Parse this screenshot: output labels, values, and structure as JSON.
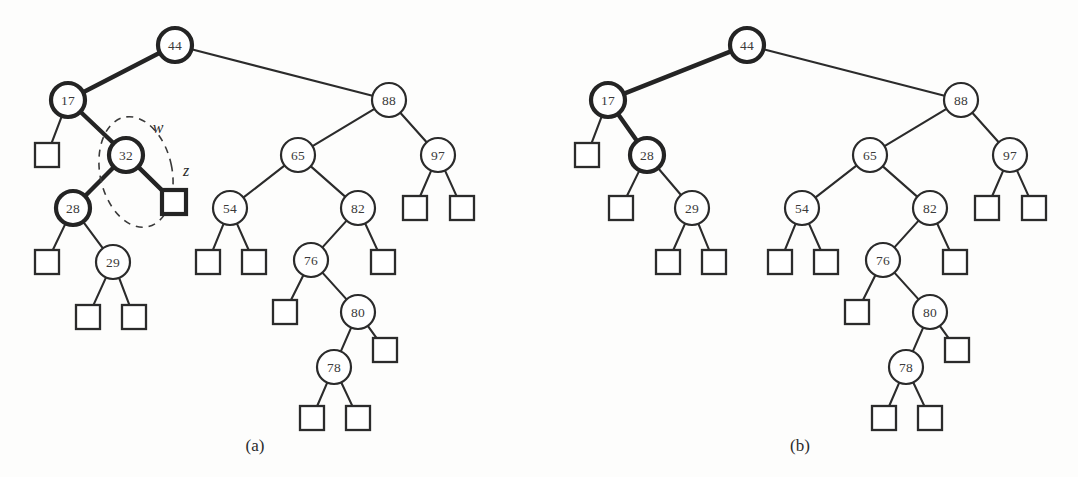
{
  "figure": {
    "background_color": "#fdfdfc",
    "ink_color": "#2b2b2b",
    "highlight_color": "#242424",
    "panels": [
      {
        "id": "a",
        "caption": "(a)",
        "caption_x": 255,
        "caption_y": 445
      },
      {
        "id": "b",
        "caption": "(b)",
        "caption_y": 445,
        "caption_x": 800
      }
    ],
    "annotations": [
      {
        "id": "w",
        "label": "w",
        "x": 158,
        "y": 127,
        "describes": "node-32"
      },
      {
        "id": "z",
        "label": "z",
        "x": 186,
        "y": 170,
        "describes": "leaf-right-of-32"
      }
    ],
    "highlight_ellipse": {
      "cx": 136,
      "cy": 172,
      "rx": 36,
      "ry": 56,
      "rotate": -12,
      "encircles": [
        "node-32",
        "leaf-right-of-32"
      ]
    }
  },
  "panel_a": {
    "caption": "(a)",
    "nodes": [
      {
        "id": "a44",
        "label": "44",
        "x": 175,
        "y": 45,
        "r": 17,
        "thick": true
      },
      {
        "id": "a17",
        "label": "17",
        "x": 68,
        "y": 100,
        "r": 17,
        "thick": true
      },
      {
        "id": "a88",
        "label": "88",
        "x": 389,
        "y": 100,
        "r": 17,
        "thick": false
      },
      {
        "id": "a32",
        "label": "32",
        "x": 126,
        "y": 155,
        "r": 17,
        "thick": true
      },
      {
        "id": "a65",
        "label": "65",
        "x": 298,
        "y": 155,
        "r": 17,
        "thick": false
      },
      {
        "id": "a97",
        "label": "97",
        "x": 438,
        "y": 155,
        "r": 17,
        "thick": false
      },
      {
        "id": "a28",
        "label": "28",
        "x": 73,
        "y": 208,
        "r": 17,
        "thick": true
      },
      {
        "id": "a54",
        "label": "54",
        "x": 230,
        "y": 208,
        "r": 17,
        "thick": false
      },
      {
        "id": "a82",
        "label": "82",
        "x": 358,
        "y": 208,
        "r": 17,
        "thick": false
      },
      {
        "id": "a29",
        "label": "29",
        "x": 113,
        "y": 262,
        "r": 17,
        "thick": false
      },
      {
        "id": "a76",
        "label": "76",
        "x": 311,
        "y": 260,
        "r": 17,
        "thick": false
      },
      {
        "id": "a80",
        "label": "80",
        "x": 358,
        "y": 312,
        "r": 17,
        "thick": false
      },
      {
        "id": "a78",
        "label": "78",
        "x": 334,
        "y": 367,
        "r": 17,
        "thick": false
      }
    ],
    "leaves": [
      {
        "id": "aL1",
        "x": 47,
        "y": 155,
        "s": 24,
        "thick": false
      },
      {
        "id": "aL2",
        "x": 174,
        "y": 202,
        "s": 24,
        "thick": true
      },
      {
        "id": "aL3",
        "x": 47,
        "y": 262,
        "s": 24,
        "thick": false
      },
      {
        "id": "aL4",
        "x": 88,
        "y": 317,
        "s": 24,
        "thick": false
      },
      {
        "id": "aL5",
        "x": 134,
        "y": 317,
        "s": 24,
        "thick": false
      },
      {
        "id": "aL6",
        "x": 208,
        "y": 262,
        "s": 24,
        "thick": false
      },
      {
        "id": "aL7",
        "x": 254,
        "y": 262,
        "s": 24,
        "thick": false
      },
      {
        "id": "aL8",
        "x": 285,
        "y": 312,
        "s": 24,
        "thick": false
      },
      {
        "id": "aL9",
        "x": 383,
        "y": 262,
        "s": 24,
        "thick": false
      },
      {
        "id": "aL10",
        "x": 385,
        "y": 350,
        "s": 24,
        "thick": false
      },
      {
        "id": "aL11",
        "x": 312,
        "y": 418,
        "s": 24,
        "thick": false
      },
      {
        "id": "aL12",
        "x": 358,
        "y": 418,
        "s": 24,
        "thick": false
      },
      {
        "id": "aL13",
        "x": 415,
        "y": 208,
        "s": 24,
        "thick": false
      },
      {
        "id": "aL14",
        "x": 462,
        "y": 208,
        "s": 24,
        "thick": false
      }
    ],
    "edges": [
      {
        "from": "a44",
        "to": "a17",
        "thick": true
      },
      {
        "from": "a44",
        "to": "a88",
        "thick": false
      },
      {
        "from": "a17",
        "to": "aL1",
        "thick": false
      },
      {
        "from": "a17",
        "to": "a32",
        "thick": true
      },
      {
        "from": "a32",
        "to": "a28",
        "thick": true
      },
      {
        "from": "a32",
        "to": "aL2",
        "thick": true
      },
      {
        "from": "a28",
        "to": "aL3",
        "thick": false
      },
      {
        "from": "a28",
        "to": "a29",
        "thick": false
      },
      {
        "from": "a29",
        "to": "aL4",
        "thick": false
      },
      {
        "from": "a29",
        "to": "aL5",
        "thick": false
      },
      {
        "from": "a88",
        "to": "a65",
        "thick": false
      },
      {
        "from": "a88",
        "to": "a97",
        "thick": false
      },
      {
        "from": "a97",
        "to": "aL13",
        "thick": false
      },
      {
        "from": "a97",
        "to": "aL14",
        "thick": false
      },
      {
        "from": "a65",
        "to": "a54",
        "thick": false
      },
      {
        "from": "a65",
        "to": "a82",
        "thick": false
      },
      {
        "from": "a54",
        "to": "aL6",
        "thick": false
      },
      {
        "from": "a54",
        "to": "aL7",
        "thick": false
      },
      {
        "from": "a82",
        "to": "a76",
        "thick": false
      },
      {
        "from": "a82",
        "to": "aL9",
        "thick": false
      },
      {
        "from": "a76",
        "to": "aL8",
        "thick": false
      },
      {
        "from": "a76",
        "to": "a80",
        "thick": false
      },
      {
        "from": "a80",
        "to": "a78",
        "thick": false
      },
      {
        "from": "a80",
        "to": "aL10",
        "thick": false
      },
      {
        "from": "a78",
        "to": "aL11",
        "thick": false
      },
      {
        "from": "a78",
        "to": "aL12",
        "thick": false
      }
    ]
  },
  "panel_b": {
    "caption": "(b)",
    "nodes": [
      {
        "id": "b44",
        "label": "44",
        "x": 747,
        "y": 45,
        "r": 17,
        "thick": true
      },
      {
        "id": "b17",
        "label": "17",
        "x": 608,
        "y": 100,
        "r": 17,
        "thick": true
      },
      {
        "id": "b88",
        "label": "88",
        "x": 961,
        "y": 100,
        "r": 17,
        "thick": false
      },
      {
        "id": "b28",
        "label": "28",
        "x": 647,
        "y": 155,
        "r": 17,
        "thick": true
      },
      {
        "id": "b65",
        "label": "65",
        "x": 870,
        "y": 155,
        "r": 17,
        "thick": false
      },
      {
        "id": "b97",
        "label": "97",
        "x": 1010,
        "y": 155,
        "r": 17,
        "thick": false
      },
      {
        "id": "b29",
        "label": "29",
        "x": 692,
        "y": 208,
        "r": 17,
        "thick": false
      },
      {
        "id": "b54",
        "label": "54",
        "x": 802,
        "y": 208,
        "r": 17,
        "thick": false
      },
      {
        "id": "b82",
        "label": "82",
        "x": 930,
        "y": 208,
        "r": 17,
        "thick": false
      },
      {
        "id": "b76",
        "label": "76",
        "x": 883,
        "y": 260,
        "r": 17,
        "thick": false
      },
      {
        "id": "b80",
        "label": "80",
        "x": 930,
        "y": 312,
        "r": 17,
        "thick": false
      },
      {
        "id": "b78",
        "label": "78",
        "x": 906,
        "y": 367,
        "r": 17,
        "thick": false
      }
    ],
    "leaves": [
      {
        "id": "bL1",
        "x": 587,
        "y": 155,
        "s": 24,
        "thick": false
      },
      {
        "id": "bL2",
        "x": 621,
        "y": 208,
        "s": 24,
        "thick": false
      },
      {
        "id": "bL3",
        "x": 668,
        "y": 262,
        "s": 24,
        "thick": false
      },
      {
        "id": "bL4",
        "x": 714,
        "y": 262,
        "s": 24,
        "thick": false
      },
      {
        "id": "bL5",
        "x": 780,
        "y": 262,
        "s": 24,
        "thick": false
      },
      {
        "id": "bL6",
        "x": 826,
        "y": 262,
        "s": 24,
        "thick": false
      },
      {
        "id": "bL7",
        "x": 857,
        "y": 312,
        "s": 24,
        "thick": false
      },
      {
        "id": "bL8",
        "x": 955,
        "y": 262,
        "s": 24,
        "thick": false
      },
      {
        "id": "bL9",
        "x": 957,
        "y": 350,
        "s": 24,
        "thick": false
      },
      {
        "id": "bL10",
        "x": 884,
        "y": 418,
        "s": 24,
        "thick": false
      },
      {
        "id": "bL11",
        "x": 930,
        "y": 418,
        "s": 24,
        "thick": false
      },
      {
        "id": "bL12",
        "x": 987,
        "y": 208,
        "s": 24,
        "thick": false
      },
      {
        "id": "bL13",
        "x": 1034,
        "y": 208,
        "s": 24,
        "thick": false
      }
    ],
    "edges": [
      {
        "from": "b44",
        "to": "b17",
        "thick": true
      },
      {
        "from": "b44",
        "to": "b88",
        "thick": false
      },
      {
        "from": "b17",
        "to": "bL1",
        "thick": false
      },
      {
        "from": "b17",
        "to": "b28",
        "thick": true
      },
      {
        "from": "b28",
        "to": "bL2",
        "thick": false
      },
      {
        "from": "b28",
        "to": "b29",
        "thick": false
      },
      {
        "from": "b29",
        "to": "bL3",
        "thick": false
      },
      {
        "from": "b29",
        "to": "bL4",
        "thick": false
      },
      {
        "from": "b88",
        "to": "b65",
        "thick": false
      },
      {
        "from": "b88",
        "to": "b97",
        "thick": false
      },
      {
        "from": "b97",
        "to": "bL12",
        "thick": false
      },
      {
        "from": "b97",
        "to": "bL13",
        "thick": false
      },
      {
        "from": "b65",
        "to": "b54",
        "thick": false
      },
      {
        "from": "b65",
        "to": "b82",
        "thick": false
      },
      {
        "from": "b54",
        "to": "bL5",
        "thick": false
      },
      {
        "from": "b54",
        "to": "bL6",
        "thick": false
      },
      {
        "from": "b82",
        "to": "b76",
        "thick": false
      },
      {
        "from": "b82",
        "to": "bL8",
        "thick": false
      },
      {
        "from": "b76",
        "to": "bL7",
        "thick": false
      },
      {
        "from": "b76",
        "to": "b80",
        "thick": false
      },
      {
        "from": "b80",
        "to": "b78",
        "thick": false
      },
      {
        "from": "b80",
        "to": "bL9",
        "thick": false
      },
      {
        "from": "b78",
        "to": "bL10",
        "thick": false
      },
      {
        "from": "b78",
        "to": "bL11",
        "thick": false
      }
    ]
  }
}
